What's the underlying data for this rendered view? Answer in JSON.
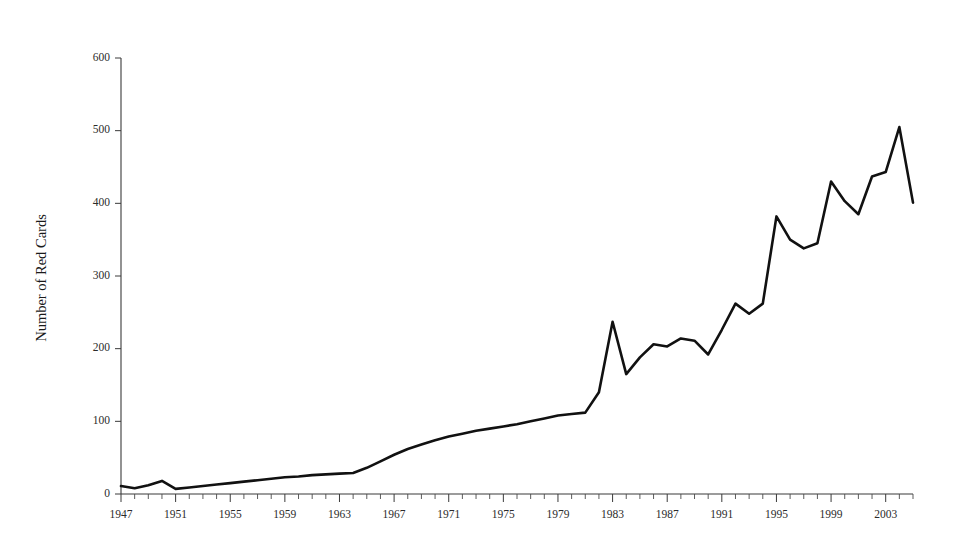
{
  "chart_data": {
    "type": "line",
    "title": "",
    "subtitle": "",
    "xlabel": "",
    "ylabel": "Number of Red Cards",
    "xlim": [
      1947,
      2005
    ],
    "ylim": [
      0,
      600
    ],
    "grid": false,
    "legend": null,
    "y_ticks": [
      0,
      100,
      200,
      300,
      400,
      500,
      600
    ],
    "y_tick_labels": [
      "0",
      "100",
      "200",
      "300",
      "400",
      "500",
      "600"
    ],
    "x_tick_labels": [
      "1947",
      "1951",
      "1955",
      "1959",
      "1963",
      "1967",
      "1971",
      "1975",
      "1979",
      "1983",
      "1987",
      "1991",
      "1995",
      "1999",
      "2003"
    ],
    "x_tick_step_years": 1,
    "x_label_step_years": 4,
    "line_color": "#111111",
    "series": [
      {
        "name": "Number of Red Cards",
        "x": [
          1947,
          1948,
          1949,
          1950,
          1951,
          1952,
          1953,
          1954,
          1955,
          1956,
          1957,
          1958,
          1959,
          1960,
          1961,
          1962,
          1963,
          1964,
          1965,
          1966,
          1967,
          1968,
          1969,
          1970,
          1971,
          1972,
          1973,
          1974,
          1975,
          1976,
          1977,
          1978,
          1979,
          1980,
          1981,
          1982,
          1983,
          1984,
          1985,
          1986,
          1987,
          1988,
          1989,
          1990,
          1991,
          1992,
          1993,
          1994,
          1995,
          1996,
          1997,
          1998,
          1999,
          2000,
          2001,
          2002,
          2003,
          2004,
          2005
        ],
        "values": [
          11,
          8,
          12,
          18,
          7,
          9,
          11,
          13,
          15,
          17,
          19,
          21,
          23,
          24,
          26,
          27,
          28,
          29,
          36,
          45,
          54,
          62,
          68,
          74,
          79,
          83,
          87,
          90,
          93,
          96,
          100,
          104,
          108,
          110,
          112,
          140,
          237,
          165,
          188,
          206,
          203,
          214,
          211,
          192,
          226,
          262,
          248,
          262,
          382,
          350,
          338,
          345,
          430,
          403,
          385,
          437,
          443,
          505,
          401
        ]
      }
    ]
  },
  "axes": {
    "y_axis_title": "Number of Red Cards"
  }
}
